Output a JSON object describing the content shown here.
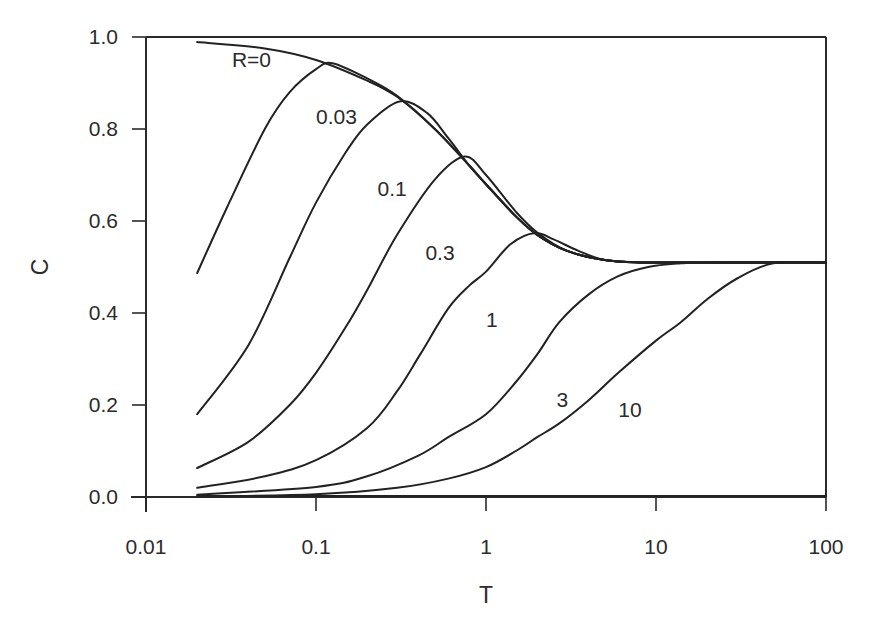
{
  "chart_data": {
    "type": "line",
    "title": "",
    "xlabel": "T",
    "ylabel": "C",
    "xscale": "log",
    "xlim": [
      0.01,
      100
    ],
    "ylim": [
      0.0,
      1.0
    ],
    "grid": false,
    "legend": "none (curves labeled inline)",
    "x_ticks": [
      {
        "value": 0.01,
        "label": "0.01"
      },
      {
        "value": 0.1,
        "label": "0.1"
      },
      {
        "value": 1,
        "label": "1"
      },
      {
        "value": 10,
        "label": "10"
      },
      {
        "value": 100,
        "label": "100"
      }
    ],
    "y_ticks": [
      {
        "value": 0.0,
        "label": "0.0"
      },
      {
        "value": 0.2,
        "label": "0.2"
      },
      {
        "value": 0.4,
        "label": "0.4"
      },
      {
        "value": 0.6,
        "label": "0.6"
      },
      {
        "value": 0.8,
        "label": "0.8"
      },
      {
        "value": 1.0,
        "label": "1.0"
      }
    ],
    "series": [
      {
        "name": "R=0",
        "label": "R=0",
        "label_pos": [
          0.032,
          0.935
        ],
        "x": [
          0.02,
          0.05,
          0.1,
          0.2,
          0.3,
          0.5,
          0.8,
          1,
          1.5,
          2,
          3,
          5,
          8,
          20,
          100
        ],
        "y": [
          0.989,
          0.975,
          0.95,
          0.905,
          0.87,
          0.8,
          0.72,
          0.68,
          0.61,
          0.57,
          0.535,
          0.515,
          0.51,
          0.51,
          0.51
        ]
      },
      {
        "name": "R=0.03",
        "label": "0.03",
        "label_pos": [
          0.1,
          0.81
        ],
        "x": [
          0.02,
          0.03,
          0.05,
          0.07,
          0.1,
          0.125,
          0.2,
          0.3,
          0.5,
          0.8,
          1,
          1.5,
          2,
          3,
          5,
          8,
          20,
          100
        ],
        "y": [
          0.487,
          0.63,
          0.8,
          0.88,
          0.93,
          0.943,
          0.91,
          0.872,
          0.8,
          0.72,
          0.68,
          0.61,
          0.57,
          0.535,
          0.515,
          0.51,
          0.51,
          0.51
        ]
      },
      {
        "name": "R=0.1",
        "label": "0.1",
        "label_pos": [
          0.23,
          0.655
        ],
        "x": [
          0.02,
          0.04,
          0.07,
          0.1,
          0.15,
          0.2,
          0.31,
          0.45,
          0.6,
          0.8,
          1,
          1.5,
          2,
          3,
          5,
          8,
          20,
          100
        ],
        "y": [
          0.18,
          0.33,
          0.52,
          0.64,
          0.75,
          0.81,
          0.86,
          0.835,
          0.78,
          0.72,
          0.68,
          0.61,
          0.57,
          0.535,
          0.515,
          0.51,
          0.51,
          0.51
        ]
      },
      {
        "name": "R=0.3",
        "label": "0.3",
        "label_pos": [
          0.44,
          0.515
        ],
        "x": [
          0.02,
          0.04,
          0.07,
          0.1,
          0.15,
          0.2,
          0.3,
          0.5,
          0.75,
          1,
          1.5,
          2,
          3,
          5,
          8,
          20,
          100
        ],
        "y": [
          0.063,
          0.12,
          0.2,
          0.27,
          0.37,
          0.45,
          0.57,
          0.69,
          0.74,
          0.7,
          0.62,
          0.575,
          0.535,
          0.515,
          0.51,
          0.51,
          0.51
        ]
      },
      {
        "name": "R=1",
        "label": "1",
        "label_pos": [
          1.0,
          0.37
        ],
        "x": [
          0.02,
          0.05,
          0.1,
          0.2,
          0.3,
          0.41,
          0.6,
          0.8,
          1,
          1.4,
          1.94,
          2.5,
          3.5,
          5,
          8,
          20,
          100
        ],
        "y": [
          0.02,
          0.045,
          0.08,
          0.15,
          0.23,
          0.31,
          0.41,
          0.46,
          0.49,
          0.55,
          0.574,
          0.56,
          0.535,
          0.515,
          0.51,
          0.51,
          0.51
        ]
      },
      {
        "name": "R=3",
        "label": "3",
        "label_pos": [
          2.6,
          0.195
        ],
        "x": [
          0.02,
          0.1,
          0.2,
          0.4,
          0.6,
          1,
          1.5,
          2,
          2.7,
          4,
          6,
          9,
          14,
          20,
          100
        ],
        "y": [
          0.005,
          0.022,
          0.045,
          0.09,
          0.13,
          0.18,
          0.25,
          0.31,
          0.38,
          0.44,
          0.48,
          0.5,
          0.508,
          0.51,
          0.51
        ]
      },
      {
        "name": "R=10",
        "label": "10",
        "label_pos": [
          6.0,
          0.175
        ],
        "x": [
          0.02,
          0.1,
          0.3,
          0.6,
          1,
          1.5,
          2,
          2.7,
          4,
          6,
          10,
          14,
          20,
          30,
          49,
          100
        ],
        "y": [
          0.001,
          0.006,
          0.02,
          0.04,
          0.065,
          0.1,
          0.13,
          0.16,
          0.21,
          0.27,
          0.34,
          0.38,
          0.43,
          0.475,
          0.508,
          0.51
        ]
      }
    ],
    "baseline": {
      "name": "C=0 line",
      "y": 0.0
    }
  },
  "layout": {
    "plot_left": 146,
    "plot_right": 826,
    "plot_top": 37,
    "plot_bottom": 497,
    "ink": "#222222"
  }
}
